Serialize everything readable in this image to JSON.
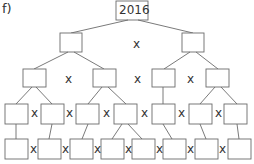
{
  "label": "f)",
  "root_value": "2016",
  "operator": "x",
  "colors": {
    "stroke": "#6b6b6b",
    "text": "#333333"
  },
  "levels": [
    {
      "level": 0,
      "boxes": 1,
      "values": [
        "2016"
      ]
    },
    {
      "level": 1,
      "boxes": 2,
      "values": [
        "",
        ""
      ]
    },
    {
      "level": 2,
      "boxes": 4,
      "values": [
        "",
        "",
        "",
        ""
      ]
    },
    {
      "level": 3,
      "boxes": 8,
      "values": [
        "",
        "",
        "",
        "",
        "",
        "",
        "",
        ""
      ]
    },
    {
      "level": 4,
      "boxes": 8,
      "values": [
        "",
        "",
        "",
        "",
        "",
        "",
        "",
        ""
      ]
    }
  ]
}
